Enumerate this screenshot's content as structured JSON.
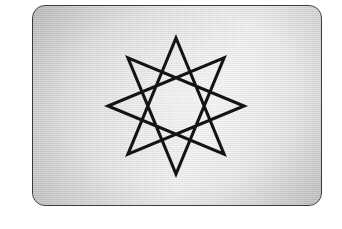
{
  "page": {
    "background_color": "#ffffff",
    "width": 342,
    "height": 229
  },
  "figure_card": {
    "name": "star-plaque",
    "border_color": "#3b3b3f",
    "border_radius_px": 13,
    "fill_light": "#ededed",
    "fill_dark": "#c9c9c9",
    "surface_finish": "brushed-metal-halftone",
    "bounds": {
      "left": 32,
      "top": 5,
      "width": 290,
      "height": 201
    }
  },
  "figure": {
    "name": "eight-pointed-star-polygon",
    "schlafli": "{8/3}",
    "stroke_color": "#141414",
    "stroke_width_px": 3.1,
    "fill": "none",
    "points": 8,
    "step": 3,
    "center": {
      "x": 143,
      "y": 100
    },
    "outer_radius_px": 68,
    "rotation_deg": -90,
    "vertices": [
      {
        "index": 0,
        "x": 143,
        "y": 32,
        "label": "top"
      },
      {
        "index": 3,
        "x": 95,
        "y": 148,
        "label": "bottom-left"
      },
      {
        "index": 6,
        "x": 211,
        "y": 100,
        "label": "right"
      },
      {
        "index": 1,
        "x": 191,
        "y": 52,
        "label": "upper-right"
      },
      {
        "index": 4,
        "x": 143,
        "y": 168,
        "label": "bottom"
      },
      {
        "index": 7,
        "x": 95,
        "y": 52,
        "label": "upper-left"
      },
      {
        "index": 2,
        "x": 211,
        "y": 148,
        "label": "lower-right"
      },
      {
        "index": 5,
        "x": 75,
        "y": 100,
        "label": "left"
      }
    ],
    "path": "M 143 32 L 95.9 148.1 L 211 100 L 191.1 148.1 L 143 32 L 94.9 148.1 L 211.1 52 L 75 100 L 191.1 51.9 Z"
  }
}
